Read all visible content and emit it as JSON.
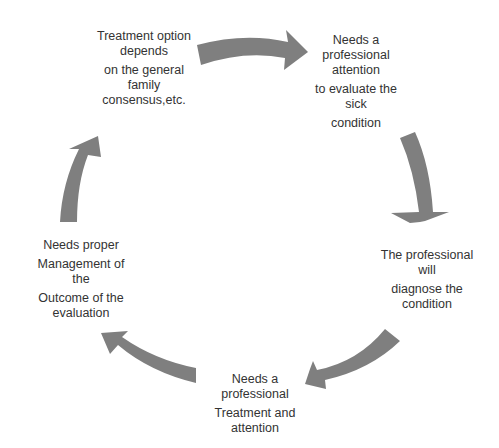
{
  "diagram": {
    "type": "cycle",
    "arrow_color": "#7f7f7f",
    "text_color": "#333333",
    "background": "#ffffff",
    "nodes": [
      {
        "id": "node-1",
        "lines": [
          "Treatment option",
          "depends",
          "on the general",
          "family",
          "consensus,etc."
        ]
      },
      {
        "id": "node-2",
        "lines": [
          "Needs a",
          "professional",
          "attention",
          "to evaluate  the",
          "sick",
          "condition"
        ]
      },
      {
        "id": "node-3",
        "lines": [
          "The professional",
          "will",
          "diagnose the",
          "condition"
        ]
      },
      {
        "id": "node-4",
        "lines": [
          "Needs a",
          "professional",
          "Treatment and",
          "attention"
        ]
      },
      {
        "id": "node-5",
        "lines": [
          "Needs proper",
          "Management  of",
          "the",
          "Outcome of the",
          "evaluation"
        ]
      }
    ],
    "edges": [
      {
        "from": "node-1",
        "to": "node-2"
      },
      {
        "from": "node-2",
        "to": "node-3"
      },
      {
        "from": "node-3",
        "to": "node-4"
      },
      {
        "from": "node-4",
        "to": "node-5"
      },
      {
        "from": "node-5",
        "to": "node-1"
      }
    ]
  }
}
